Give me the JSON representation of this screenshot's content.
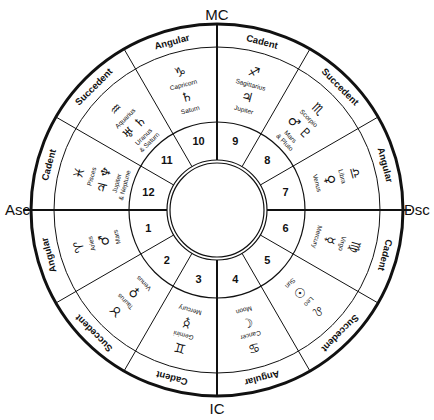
{
  "diagram": {
    "type": "astrological-house-wheel",
    "axes": {
      "top": "MC",
      "bottom": "IC",
      "left": "Asc",
      "right": "Dsc"
    },
    "houses": [
      {
        "number": "1",
        "band": "Angular",
        "sign_glyph": "♈",
        "sign": "Aries",
        "planet_glyph": "♂",
        "planet": "Mars"
      },
      {
        "number": "2",
        "band": "Succedent",
        "sign_glyph": "♉",
        "sign": "Taurus",
        "planet_glyph": "♀",
        "planet": "Venus"
      },
      {
        "number": "3",
        "band": "Cadent",
        "sign_glyph": "♊",
        "sign": "Gemini",
        "planet_glyph": "☿",
        "planet": "Mercury"
      },
      {
        "number": "4",
        "band": "Angular",
        "sign_glyph": "♋",
        "sign": "Cancer",
        "planet_glyph": "☾",
        "planet": "Moon"
      },
      {
        "number": "5",
        "band": "Succedent",
        "sign_glyph": "♌",
        "sign": "Leo",
        "planet_glyph": "☉",
        "planet": "Sun"
      },
      {
        "number": "6",
        "band": "Cadent",
        "sign_glyph": "♍",
        "sign": "Virgo",
        "planet_glyph": "☿",
        "planet": "Mercury"
      },
      {
        "number": "7",
        "band": "Angular",
        "sign_glyph": "♎",
        "sign": "Libra",
        "planet_glyph": "♀",
        "planet": "Venus"
      },
      {
        "number": "8",
        "band": "Succedent",
        "sign_glyph": "♏",
        "sign": "Scorpio",
        "planet_glyph": "♂ ♇",
        "planet": "Mars",
        "planet2": "& Pluto"
      },
      {
        "number": "9",
        "band": "Cadent",
        "sign_glyph": "♐",
        "sign": "Sagittarius",
        "planet_glyph": "♃",
        "planet": "Jupiter"
      },
      {
        "number": "10",
        "band": "Angular",
        "sign_glyph": "♑",
        "sign": "Capricorn",
        "planet_glyph": "♄",
        "planet": "Saturn"
      },
      {
        "number": "11",
        "band": "Succedent",
        "sign_glyph": "♒",
        "sign": "Aquarius",
        "planet_glyph": "♅ ♄",
        "planet": "Uranus",
        "planet2": "& Saturn"
      },
      {
        "number": "12",
        "band": "Cadent",
        "sign_glyph": "♓",
        "sign": "Pisces",
        "planet_glyph": "♃ ♆",
        "planet": "Jupiter",
        "planet2": "& Neptune"
      }
    ],
    "colors": {
      "line": "#111111",
      "background": "#ffffff"
    }
  }
}
